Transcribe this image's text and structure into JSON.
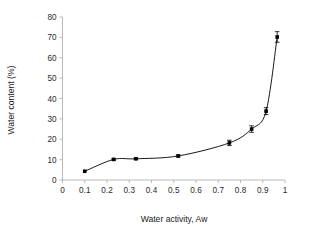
{
  "chart_data": {
    "type": "line",
    "title": "",
    "xlabel": "Water activity, Aw",
    "ylabel": "Water content (%)",
    "xlim": [
      0,
      1
    ],
    "ylim": [
      0,
      80
    ],
    "xticks": [
      0,
      0.1,
      0.2,
      0.3,
      0.4,
      0.5,
      0.6,
      0.7,
      0.8,
      0.9,
      1
    ],
    "xtick_labels": [
      "0",
      "0.1",
      "0.2",
      "0.3",
      "0.4",
      "0.5",
      "0.6",
      "0.7",
      "0.8",
      "0.9",
      "1"
    ],
    "yticks": [
      0,
      10,
      20,
      30,
      40,
      50,
      60,
      70,
      80
    ],
    "ytick_labels": [
      "0",
      "10",
      "20",
      "30",
      "40",
      "50",
      "60",
      "70",
      "80"
    ],
    "grid": false,
    "legend": null,
    "marker": "filled-square",
    "x": [
      0.1,
      0.23,
      0.33,
      0.52,
      0.75,
      0.85,
      0.915,
      0.965
    ],
    "y": [
      4.3,
      10.1,
      10.4,
      11.8,
      18.2,
      25.0,
      33.8,
      70.2
    ],
    "yerr": [
      0.0,
      0.4,
      0.3,
      0.5,
      1.3,
      1.6,
      1.7,
      2.6
    ],
    "series": [
      {
        "name": "Water sorption isotherm",
        "x": [
          0.1,
          0.23,
          0.33,
          0.52,
          0.75,
          0.85,
          0.915,
          0.965
        ],
        "values": [
          4.3,
          10.1,
          10.4,
          11.8,
          18.2,
          25.0,
          33.8,
          70.2
        ],
        "yerr": [
          0.0,
          0.4,
          0.3,
          0.5,
          1.3,
          1.6,
          1.7,
          2.6
        ]
      }
    ],
    "colors": {
      "line": "#000000",
      "marker": "#000000",
      "axis": "#a8a8a8",
      "text": "#2a2a2a",
      "background": "#ffffff"
    }
  }
}
